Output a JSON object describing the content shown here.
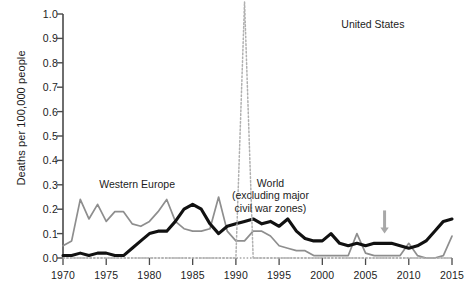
{
  "chart_data": {
    "type": "line",
    "title": "",
    "xlabel": "",
    "ylabel": "Deaths per 100,000 people",
    "xlim": [
      1970,
      2015
    ],
    "ylim": [
      0.0,
      1.0
    ],
    "grid": false,
    "legend_position": "inline-annotations",
    "x_ticks": [
      "1970",
      "1975",
      "1980",
      "1985",
      "1990",
      "1995",
      "2000",
      "2005",
      "2010",
      "2015"
    ],
    "x_tick_values": [
      1970,
      1975,
      1980,
      1985,
      1990,
      1995,
      2000,
      2005,
      2010,
      2015
    ],
    "y_ticks": [
      "0.0",
      "0.1",
      "0.2",
      "0.3",
      "0.4",
      "0.5",
      "0.6",
      "0.7",
      "0.8",
      "0.9",
      "1.0"
    ],
    "y_tick_values": [
      0.0,
      0.1,
      0.2,
      0.3,
      0.4,
      0.5,
      0.6,
      0.7,
      0.8,
      0.9,
      1.0
    ],
    "x": [
      1970,
      1971,
      1972,
      1973,
      1974,
      1975,
      1976,
      1977,
      1978,
      1979,
      1980,
      1981,
      1982,
      1983,
      1984,
      1985,
      1986,
      1987,
      1988,
      1989,
      1990,
      1991,
      1992,
      1993,
      1994,
      1995,
      1996,
      1997,
      1998,
      1999,
      2000,
      2001,
      2002,
      2003,
      2004,
      2005,
      2006,
      2007,
      2008,
      2009,
      2010,
      2011,
      2012,
      2013,
      2014,
      2015
    ],
    "series": [
      {
        "name": "Western Europe",
        "color": "#8e8e8e",
        "style": "solid",
        "values": [
          0.05,
          0.07,
          0.24,
          0.16,
          0.22,
          0.15,
          0.19,
          0.19,
          0.14,
          0.13,
          0.15,
          0.19,
          0.24,
          0.15,
          0.12,
          0.11,
          0.11,
          0.12,
          0.25,
          0.11,
          0.07,
          0.07,
          0.11,
          0.11,
          0.09,
          0.05,
          0.04,
          0.03,
          0.03,
          0.01,
          0.01,
          0.01,
          0.01,
          0.01,
          0.1,
          0.02,
          0.01,
          0.01,
          0.01,
          0.01,
          0.06,
          0.01,
          0.0,
          0.0,
          0.01,
          0.09
        ]
      },
      {
        "name": "World (excluding major civil war zones)",
        "color": "#111111",
        "style": "solid",
        "values": [
          0.01,
          0.01,
          0.02,
          0.01,
          0.02,
          0.02,
          0.01,
          0.01,
          0.04,
          0.07,
          0.1,
          0.11,
          0.11,
          0.15,
          0.2,
          0.22,
          0.2,
          0.14,
          0.1,
          0.13,
          0.14,
          0.15,
          0.16,
          0.14,
          0.15,
          0.13,
          0.16,
          0.11,
          0.08,
          0.07,
          0.07,
          0.1,
          0.06,
          0.05,
          0.06,
          0.05,
          0.06,
          0.06,
          0.06,
          0.05,
          0.04,
          0.05,
          0.07,
          0.11,
          0.15,
          0.16
        ]
      },
      {
        "name": "United States",
        "color": "#b0b0b0",
        "style": "dotted",
        "values": [
          0.0,
          0.0,
          0.0,
          0.0,
          0.0,
          0.0,
          0.0,
          0.0,
          0.0,
          0.0,
          0.0,
          0.0,
          0.0,
          0.0,
          0.0,
          0.0,
          0.0,
          0.0,
          0.0,
          0.0,
          0.0,
          1.05,
          0.0,
          0.0,
          0.0,
          0.0,
          0.0,
          0.0,
          0.0,
          0.0,
          0.0,
          0.0,
          0.0,
          0.0,
          0.0,
          0.0,
          0.0,
          0.0,
          0.0,
          0.0,
          0.0,
          0.0,
          0.0,
          0.0,
          0.0,
          0.0
        ]
      }
    ],
    "annotations": [
      {
        "text": "Western Europe",
        "x": 1974.2,
        "y": 0.3,
        "name": "western-europe"
      },
      {
        "text": "World",
        "x": 1994.0,
        "y": 0.305,
        "name": "world-heading"
      },
      {
        "text": "(excluding major",
        "x": 1994.0,
        "y": 0.265,
        "name": "world-sub-1"
      },
      {
        "text": "civil war zones)",
        "x": 1994.0,
        "y": 0.225,
        "name": "world-sub-2"
      },
      {
        "text": "United States",
        "x": 2002.2,
        "y": 0.955,
        "name": "united-states"
      }
    ],
    "marker_arrow": {
      "x": 2007.2,
      "y_top": 0.195,
      "y_bottom": 0.1,
      "color": "#a8a8a8"
    }
  },
  "axis": {
    "y_title": "Deaths per 100,000 people"
  }
}
